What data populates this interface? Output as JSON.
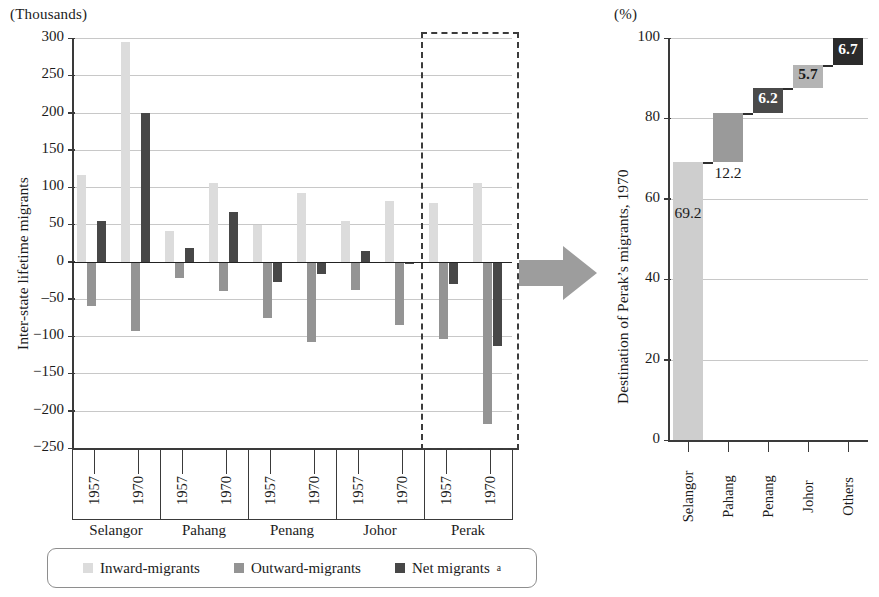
{
  "chart_data": [
    {
      "type": "bar",
      "panel": "left",
      "title": "",
      "unit_label": "(Thousands)",
      "ylabel": "Inter-state lifetime migrants",
      "xlabel": "",
      "ylim": [
        -250,
        300
      ],
      "yticks": [
        300,
        250,
        200,
        150,
        100,
        50,
        0,
        -50,
        -100,
        -150,
        -200,
        -250
      ],
      "ytick_labels": [
        "300",
        "250",
        "200",
        "150",
        "100",
        "50",
        "0",
        "‒50",
        "−100",
        "−150",
        "−200",
        "−250"
      ],
      "grid": true,
      "legend_position": "bottom",
      "categories": [
        "Selangor 1957",
        "Selangor 1970",
        "Pahang 1957",
        "Pahang 1970",
        "Penang 1957",
        "Penang 1970",
        "Johor 1957",
        "Johor 1970",
        "Perak 1957",
        "Perak 1970"
      ],
      "groups": [
        {
          "state": "Selangor",
          "years": [
            "1957",
            "1970"
          ]
        },
        {
          "state": "Pahang",
          "years": [
            "1957",
            "1970"
          ]
        },
        {
          "state": "Penang",
          "years": [
            "1957",
            "1970"
          ]
        },
        {
          "state": "Johor",
          "years": [
            "1957",
            "1970"
          ]
        },
        {
          "state": "Perak",
          "years": [
            "1957",
            "1970"
          ]
        }
      ],
      "series": [
        {
          "name": "Inward-migrants",
          "color": "#dcdcdc",
          "values": [
            116,
            295,
            41,
            106,
            49,
            92,
            55,
            82,
            78,
            105
          ]
        },
        {
          "name": "Outward-migrants",
          "color": "#949494",
          "values": [
            -60,
            -93,
            -22,
            -39,
            -76,
            -108,
            -38,
            -85,
            -104,
            -218
          ]
        },
        {
          "name": "Net migrants",
          "color": "#474747",
          "values": [
            55,
            200,
            18,
            66,
            -28,
            -17,
            14,
            -3,
            -30,
            -113
          ]
        }
      ],
      "highlight": {
        "group": "Perak",
        "style": "dashed-box"
      }
    },
    {
      "type": "bar",
      "panel": "right",
      "chart_style": "waterfall",
      "unit_label": "(%)",
      "ylabel": "Destination of Perak’s migrants, 1970",
      "xlabel": "",
      "ylim": [
        0,
        100
      ],
      "yticks": [
        100,
        80,
        60,
        40,
        20,
        0
      ],
      "ytick_labels": [
        "100",
        "80",
        "60",
        "40",
        "20",
        "0"
      ],
      "grid": true,
      "categories": [
        "Selangor",
        "Pahang",
        "Penang",
        "Johor",
        "Others"
      ],
      "values": [
        69.2,
        12.2,
        6.2,
        5.7,
        6.7
      ],
      "value_labels": [
        "69.2",
        "12.2",
        "6.2",
        "5.7",
        "6.7"
      ],
      "cumulative_start": [
        0,
        69.2,
        81.4,
        87.6,
        93.3
      ],
      "cumulative_end": [
        69.2,
        81.4,
        87.6,
        93.3,
        100.0
      ],
      "bar_colors": [
        "#cecece",
        "#9a9a9a",
        "#4a4a4a",
        "#b4b4b4",
        "#2b2b2b"
      ],
      "label_colors": [
        "#1b1b1b",
        "#1b1b1b",
        "#ffffff",
        "#1b1b1b",
        "#ffffff"
      ],
      "connector_style": "dashed"
    }
  ],
  "left": {
    "unit_label": "(Thousands)",
    "axis_title": "Inter-state lifetime migrants",
    "ytick_labels": [
      "300",
      "250",
      "200",
      "150",
      "100",
      "50",
      "0",
      "‒50",
      "−100",
      "−150",
      "−200",
      "−250"
    ],
    "groups": [
      {
        "state": "Selangor",
        "years": [
          "1957",
          "1970"
        ]
      },
      {
        "state": "Pahang",
        "years": [
          "1957",
          "1970"
        ]
      },
      {
        "state": "Penang",
        "years": [
          "1957",
          "1970"
        ]
      },
      {
        "state": "Johor",
        "years": [
          "1957",
          "1970"
        ]
      },
      {
        "state": "Perak",
        "years": [
          "1957",
          "1970"
        ]
      }
    ]
  },
  "right": {
    "unit_label": "(%)",
    "axis_title": "Destination of Perak’s migrants, 1970",
    "ytick_labels": [
      "100",
      "80",
      "60",
      "40",
      "20",
      "0"
    ],
    "categories": [
      "Selangor",
      "Pahang",
      "Penang",
      "Johor",
      "Others"
    ],
    "value_labels": [
      "69.2",
      "12.2",
      "6.2",
      "5.7",
      "6.7"
    ]
  },
  "legend": {
    "items": [
      {
        "label": "Inward-migrants",
        "color": "#dcdcdc",
        "note": ""
      },
      {
        "label": "Outward-migrants",
        "color": "#949494",
        "note": ""
      },
      {
        "label": "Net migrants",
        "color": "#474747",
        "note": "a"
      }
    ]
  },
  "arrow": {
    "name": "flow-arrow",
    "color": "#9d9d9d",
    "direction": "right"
  }
}
